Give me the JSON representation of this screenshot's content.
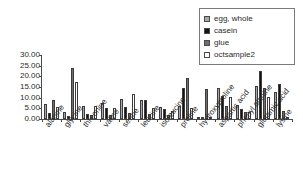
{
  "chart_data": {
    "type": "bar",
    "title": "",
    "subtitle": "",
    "xlabel": "",
    "ylabel": "",
    "ylim": [
      0,
      30
    ],
    "ytick_step": 5,
    "ytick_labels": [
      "30.00",
      "25.00",
      "20.00",
      "15.00",
      "10.00",
      "5.00",
      "0.00"
    ],
    "ytick_values": [
      30,
      25,
      20,
      15,
      10,
      5,
      0
    ],
    "grid": false,
    "legend_position": "top-right",
    "categories": [
      "alanine",
      "glycine",
      "threonine",
      "valine",
      "serine",
      "leucine",
      "isoleucine",
      "proline",
      "hydroxyproline",
      "aspartic acid",
      "phenyl alanine",
      "glutamic acid",
      "lysine"
    ],
    "series": [
      {
        "name": "egg, whole",
        "color": "#a8a8a8",
        "values": [
          7.2,
          3.5,
          6.1,
          7.4,
          9.3,
          8.8,
          5.4,
          6.0,
          0.2,
          14.6,
          6.6,
          15.7,
          12.5
        ]
      },
      {
        "name": "casein",
        "color": "#141414",
        "values": [
          2.8,
          1.2,
          2.4,
          5.0,
          5.8,
          9.0,
          4.5,
          14.4,
          0.1,
          11.0,
          4.5,
          22.4,
          16.3
        ]
      },
      {
        "name": "glue",
        "color": "#6e6e6e",
        "values": [
          8.9,
          24.0,
          1.8,
          2.0,
          2.7,
          2.4,
          1.7,
          19.0,
          14.2,
          6.0,
          3.3,
          14.5,
          3.8
        ]
      },
      {
        "name": "octsample2",
        "color": "#ffffff",
        "values": [
          5.8,
          17.4,
          6.2,
          5.3,
          11.8,
          5.0,
          3.7,
          5.0,
          0.2,
          10.3,
          3.3,
          10.1,
          1.0
        ]
      }
    ]
  },
  "legend": {
    "items": [
      {
        "label": "egg, whole",
        "swatch_color": "#a8a8a8"
      },
      {
        "label": "casein",
        "swatch_color": "#141414"
      },
      {
        "label": "glue",
        "swatch_color": "#6e6e6e"
      },
      {
        "label": "octsample2",
        "swatch_color": "#ffffff"
      }
    ]
  },
  "colors": {
    "axis": "#4a4a4a",
    "text": "#2b2b2b",
    "background": "#ffffff",
    "legend_border": "#7a7a7a"
  }
}
